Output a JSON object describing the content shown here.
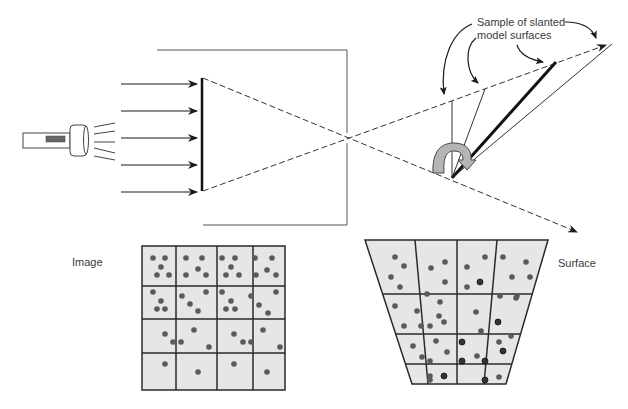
{
  "labels": {
    "annotation_line1": "Sample of slanted",
    "annotation_line2": "model surfaces",
    "image": "Image",
    "surface": "Surface"
  },
  "colors": {
    "line": "#222222",
    "box": "#555555",
    "grid_fill": "#e6e6e6",
    "grid_line": "#2a2a2a",
    "dot": "#5a5a5a",
    "dot_dark": "#333333",
    "rotate_arrow_fill": "#b5b5b5",
    "switch": "#666666"
  },
  "components": {
    "light_source": "flashlight-icon",
    "incident_rays": 5,
    "camera_box": "pinhole-camera-box",
    "image_plane": "image-plane",
    "rotation": "rotate-arrow-icon"
  },
  "image_grid": {
    "rows": 4,
    "cols": 4,
    "x": 142,
    "y": 246,
    "w": 143,
    "h": 144,
    "col_lines": [
      176,
      217,
      253
    ],
    "row_lines": [
      286,
      319,
      353
    ],
    "dots": [
      [
        153,
        258
      ],
      [
        165,
        258
      ],
      [
        161,
        267
      ],
      [
        157,
        275
      ],
      [
        169,
        275
      ],
      [
        186,
        258
      ],
      [
        202,
        258
      ],
      [
        198,
        269
      ],
      [
        186,
        275
      ],
      [
        206,
        275
      ],
      [
        222,
        258
      ],
      [
        235,
        258
      ],
      [
        231,
        267
      ],
      [
        226,
        275
      ],
      [
        239,
        275
      ],
      [
        255,
        258
      ],
      [
        272,
        258
      ],
      [
        267,
        270
      ],
      [
        256,
        275
      ],
      [
        276,
        275
      ],
      [
        153,
        292
      ],
      [
        161,
        301
      ],
      [
        157,
        309
      ],
      [
        165,
        309
      ],
      [
        182,
        296
      ],
      [
        190,
        304
      ],
      [
        198,
        311
      ],
      [
        206,
        292
      ],
      [
        222,
        292
      ],
      [
        231,
        301
      ],
      [
        226,
        309
      ],
      [
        235,
        309
      ],
      [
        251,
        296
      ],
      [
        276,
        292
      ],
      [
        259,
        305
      ],
      [
        268,
        313
      ],
      [
        165,
        334
      ],
      [
        173,
        342
      ],
      [
        181,
        342
      ],
      [
        194,
        330
      ],
      [
        209,
        347
      ],
      [
        234,
        334
      ],
      [
        243,
        342
      ],
      [
        251,
        342
      ],
      [
        263,
        330
      ],
      [
        280,
        347
      ],
      [
        165,
        364
      ],
      [
        198,
        372
      ],
      [
        234,
        364
      ],
      [
        267,
        372
      ]
    ]
  },
  "surface_grid": {
    "rows": 4,
    "cols": 4,
    "top_left": [
      365,
      240
    ],
    "top_right": [
      548,
      240
    ],
    "bottom_left": [
      412,
      384
    ],
    "bottom_right": [
      506,
      384
    ],
    "row_lines_y": [
      294,
      334,
      364
    ],
    "dots": [
      [
        395,
        257
      ],
      [
        404,
        266
      ],
      [
        391,
        277
      ],
      [
        400,
        287
      ],
      [
        431,
        268
      ],
      [
        445,
        262
      ],
      [
        445,
        282
      ],
      [
        427,
        294
      ],
      [
        485,
        257
      ],
      [
        467,
        267
      ],
      [
        467,
        287
      ],
      [
        503,
        257
      ],
      [
        526,
        262
      ],
      [
        512,
        277
      ],
      [
        530,
        277
      ],
      [
        517,
        296
      ],
      [
        395,
        306
      ],
      [
        417,
        311
      ],
      [
        404,
        326
      ],
      [
        421,
        326
      ],
      [
        430,
        326
      ],
      [
        440,
        302
      ],
      [
        439,
        316
      ],
      [
        444,
        322
      ],
      [
        476,
        312
      ],
      [
        500,
        296
      ],
      [
        516,
        298
      ],
      [
        498,
        322
      ],
      [
        481,
        331
      ],
      [
        511,
        336
      ],
      [
        413,
        346
      ],
      [
        422,
        357
      ],
      [
        436,
        341
      ],
      [
        447,
        352
      ],
      [
        430,
        361
      ],
      [
        430,
        376
      ],
      [
        430,
        380
      ],
      [
        477,
        356
      ],
      [
        499,
        342
      ],
      [
        499,
        377
      ]
    ],
    "dark_dots": [
      [
        480,
        282
      ],
      [
        462,
        342
      ],
      [
        503,
        351
      ],
      [
        462,
        361
      ],
      [
        485,
        361
      ],
      [
        444,
        376
      ],
      [
        485,
        380
      ],
      [
        498,
        322
      ]
    ]
  }
}
